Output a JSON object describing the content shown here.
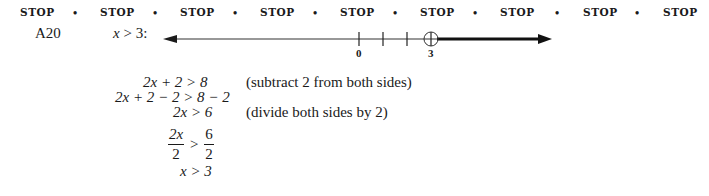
{
  "header": {
    "stop_labels": [
      "STOP",
      "STOP",
      "STOP",
      "STOP",
      "STOP",
      "STOP",
      "STOP",
      "STOP",
      "STOP"
    ],
    "separator": "•"
  },
  "problem": {
    "id": "A20",
    "statement_var": "x",
    "statement_rest": " > 3:",
    "number_line": {
      "tick_labels": [
        "0",
        "3"
      ],
      "ticks": [
        0,
        1,
        2,
        3
      ],
      "open_circle_at": 3,
      "shaded_direction": "right"
    },
    "steps": [
      {
        "lhs": "2x + 2 > 8",
        "note": "(subtract 2 from both sides)"
      },
      {
        "lhs": "2x + 2 − 2 > 8 − 2",
        "note": ""
      },
      {
        "lhs": "2x > 6",
        "note": "(divide both sides by 2)"
      },
      {
        "frac_left_num": "2x",
        "frac_left_den": "2",
        "op": ">",
        "frac_right_num": "6",
        "frac_right_den": "2"
      },
      {
        "lhs": "x > 3",
        "note": ""
      }
    ]
  }
}
